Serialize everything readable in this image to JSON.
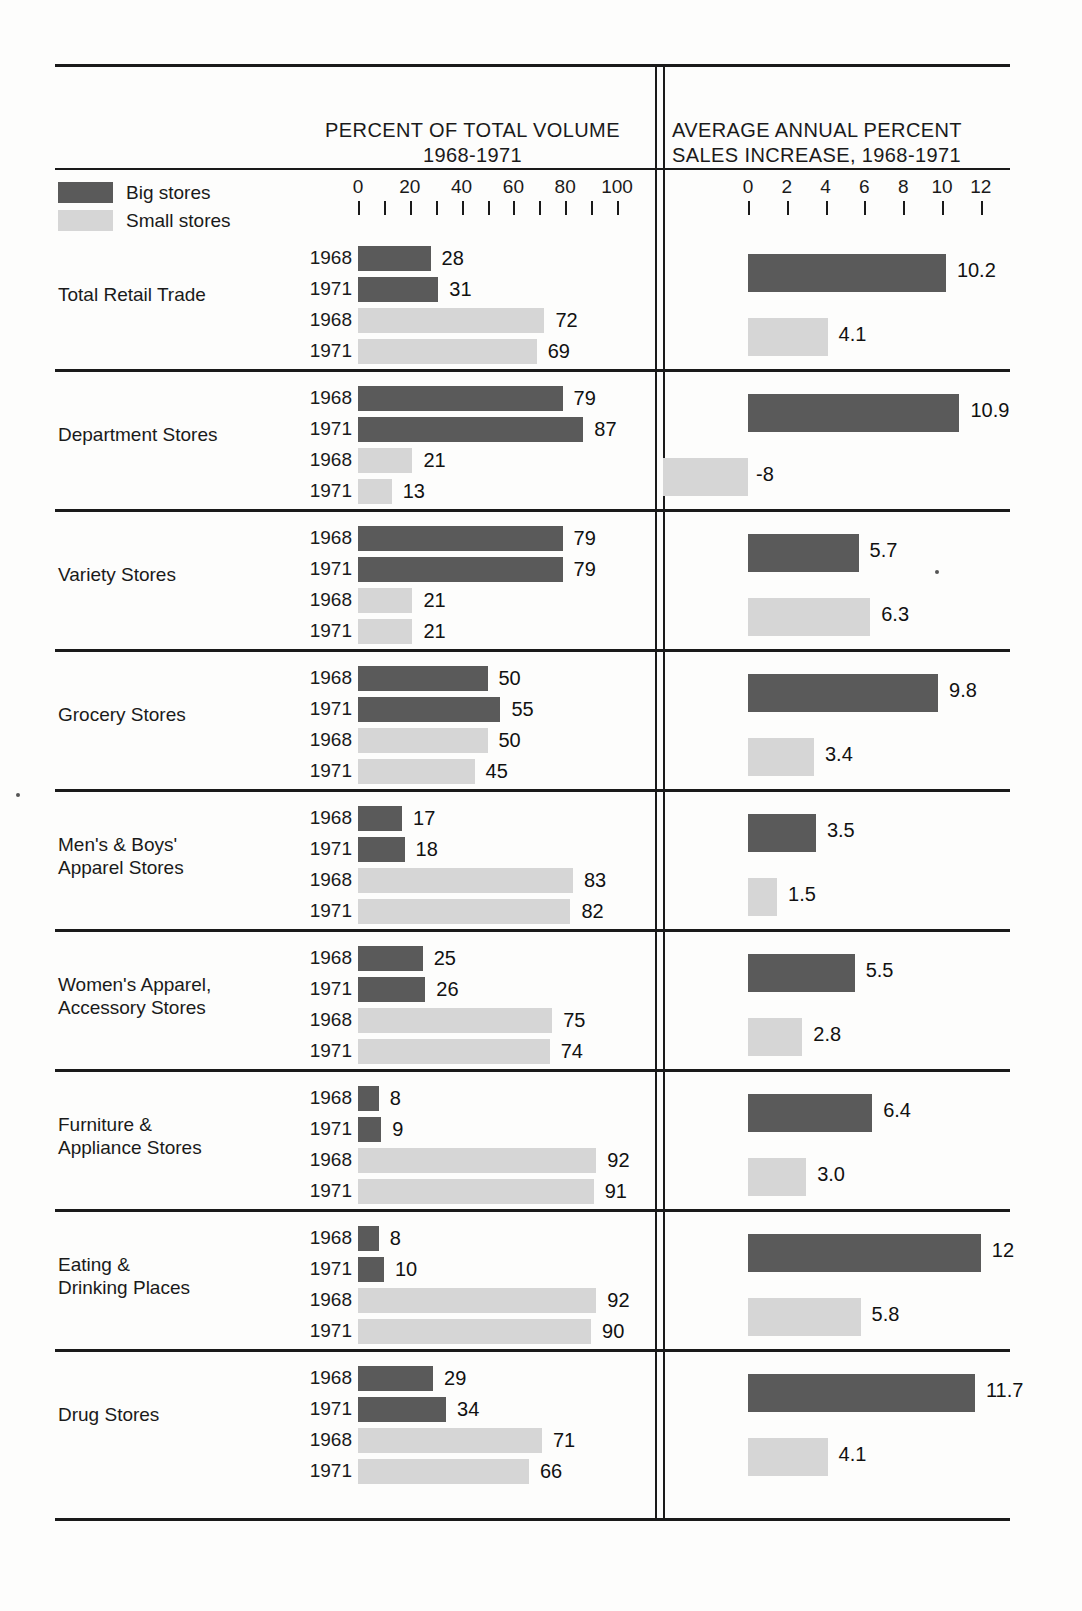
{
  "headers": {
    "left_title_line1": "PERCENT OF TOTAL VOLUME",
    "left_title_line2": "1968-1971",
    "right_title_line1": "AVERAGE ANNUAL PERCENT",
    "right_title_line2": "SALES INCREASE, 1968-1971"
  },
  "legend": {
    "big_label": "Big stores",
    "small_label": "Small stores",
    "big_color": "#5a5a5a",
    "small_color": "#d6d6d6"
  },
  "axes": {
    "left": {
      "labels": [
        "0",
        "20",
        "40",
        "60",
        "80",
        "100"
      ],
      "min": 0,
      "max": 100,
      "tick_step": 10
    },
    "right": {
      "labels": [
        "0",
        "2",
        "4",
        "6",
        "8",
        "10",
        "12"
      ],
      "min": 0,
      "max": 12,
      "tick_step": 2
    }
  },
  "years": {
    "y1": "1968",
    "y2": "1971"
  },
  "chart_data": {
    "type": "bar",
    "xlabel": "",
    "ylabel": "",
    "panels": [
      {
        "name": "percent-of-total-volume",
        "title": "PERCENT OF TOTAL VOLUME 1968-1971",
        "xlim": [
          0,
          100
        ],
        "tick_step": 10,
        "tick_labels": [
          "0",
          "20",
          "40",
          "60",
          "80",
          "100"
        ]
      },
      {
        "name": "average-annual-percent-sales-increase",
        "title": "AVERAGE ANNUAL PERCENT SALES INCREASE, 1968-1971",
        "xlim": [
          0,
          12
        ],
        "tick_step": 2,
        "tick_labels": [
          "0",
          "2",
          "4",
          "6",
          "8",
          "10",
          "12"
        ]
      }
    ],
    "legend": [
      "Big stores",
      "Small stores"
    ],
    "legend_position": "top-left",
    "grid": false,
    "categories": [
      "Total Retail Trade",
      "Department Stores",
      "Variety Stores",
      "Grocery Stores",
      "Men's & Boys' Apparel Stores",
      "Women's Apparel, Accessory Stores",
      "Furniture & Appliance Stores",
      "Eating & Drinking Places",
      "Drug Stores"
    ],
    "series": [
      {
        "name": "Big stores share 1968",
        "panel": "percent-of-total-volume",
        "values": [
          28,
          79,
          79,
          50,
          17,
          25,
          8,
          8,
          29
        ]
      },
      {
        "name": "Big stores share 1971",
        "panel": "percent-of-total-volume",
        "values": [
          31,
          87,
          79,
          55,
          18,
          26,
          9,
          10,
          34
        ]
      },
      {
        "name": "Small stores share 1968",
        "panel": "percent-of-total-volume",
        "values": [
          72,
          21,
          21,
          50,
          83,
          75,
          92,
          92,
          71
        ]
      },
      {
        "name": "Small stores share 1971",
        "panel": "percent-of-total-volume",
        "values": [
          69,
          13,
          21,
          45,
          82,
          74,
          91,
          90,
          66
        ]
      },
      {
        "name": "Big stores sales increase",
        "panel": "average-annual-percent-sales-increase",
        "values": [
          10.2,
          10.9,
          5.7,
          9.8,
          3.5,
          5.5,
          6.4,
          12,
          11.7
        ]
      },
      {
        "name": "Small stores sales increase",
        "panel": "average-annual-percent-sales-increase",
        "values": [
          4.1,
          -8,
          6.3,
          3.4,
          1.5,
          2.8,
          3.0,
          5.8,
          4.1
        ]
      }
    ]
  },
  "groups": [
    {
      "name_line1": "Total Retail Trade",
      "name_line2": "",
      "left": [
        {
          "year": "1968",
          "type": "big",
          "value": 28,
          "label": "28"
        },
        {
          "year": "1971",
          "type": "big",
          "value": 31,
          "label": "31"
        },
        {
          "year": "1968",
          "type": "small",
          "value": 72,
          "label": "72"
        },
        {
          "year": "1971",
          "type": "small",
          "value": 69,
          "label": "69"
        }
      ],
      "right": [
        {
          "type": "big",
          "value": 10.2,
          "label": "10.2"
        },
        {
          "type": "small",
          "value": 4.1,
          "label": "4.1"
        }
      ]
    },
    {
      "name_line1": "Department Stores",
      "name_line2": "",
      "left": [
        {
          "year": "1968",
          "type": "big",
          "value": 79,
          "label": "79"
        },
        {
          "year": "1971",
          "type": "big",
          "value": 87,
          "label": "87"
        },
        {
          "year": "1968",
          "type": "small",
          "value": 21,
          "label": "21"
        },
        {
          "year": "1971",
          "type": "small",
          "value": 13,
          "label": "13"
        }
      ],
      "right": [
        {
          "type": "big",
          "value": 10.9,
          "label": "10.9"
        },
        {
          "type": "small",
          "value": -8,
          "label": "-8"
        }
      ]
    },
    {
      "name_line1": "Variety Stores",
      "name_line2": "",
      "left": [
        {
          "year": "1968",
          "type": "big",
          "value": 79,
          "label": "79"
        },
        {
          "year": "1971",
          "type": "big",
          "value": 79,
          "label": "79"
        },
        {
          "year": "1968",
          "type": "small",
          "value": 21,
          "label": "21"
        },
        {
          "year": "1971",
          "type": "small",
          "value": 21,
          "label": "21"
        }
      ],
      "right": [
        {
          "type": "big",
          "value": 5.7,
          "label": "5.7"
        },
        {
          "type": "small",
          "value": 6.3,
          "label": "6.3"
        }
      ]
    },
    {
      "name_line1": "Grocery Stores",
      "name_line2": "",
      "left": [
        {
          "year": "1968",
          "type": "big",
          "value": 50,
          "label": "50"
        },
        {
          "year": "1971",
          "type": "big",
          "value": 55,
          "label": "55"
        },
        {
          "year": "1968",
          "type": "small",
          "value": 50,
          "label": "50"
        },
        {
          "year": "1971",
          "type": "small",
          "value": 45,
          "label": "45"
        }
      ],
      "right": [
        {
          "type": "big",
          "value": 9.8,
          "label": "9.8"
        },
        {
          "type": "small",
          "value": 3.4,
          "label": "3.4"
        }
      ]
    },
    {
      "name_line1": "Men's & Boys'",
      "name_line2": "Apparel Stores",
      "left": [
        {
          "year": "1968",
          "type": "big",
          "value": 17,
          "label": "17"
        },
        {
          "year": "1971",
          "type": "big",
          "value": 18,
          "label": "18"
        },
        {
          "year": "1968",
          "type": "small",
          "value": 83,
          "label": "83"
        },
        {
          "year": "1971",
          "type": "small",
          "value": 82,
          "label": "82"
        }
      ],
      "right": [
        {
          "type": "big",
          "value": 3.5,
          "label": "3.5"
        },
        {
          "type": "small",
          "value": 1.5,
          "label": "1.5"
        }
      ]
    },
    {
      "name_line1": "Women's Apparel,",
      "name_line2": "Accessory Stores",
      "left": [
        {
          "year": "1968",
          "type": "big",
          "value": 25,
          "label": "25"
        },
        {
          "year": "1971",
          "type": "big",
          "value": 26,
          "label": "26"
        },
        {
          "year": "1968",
          "type": "small",
          "value": 75,
          "label": "75"
        },
        {
          "year": "1971",
          "type": "small",
          "value": 74,
          "label": "74"
        }
      ],
      "right": [
        {
          "type": "big",
          "value": 5.5,
          "label": "5.5"
        },
        {
          "type": "small",
          "value": 2.8,
          "label": "2.8"
        }
      ]
    },
    {
      "name_line1": "Furniture &",
      "name_line2": "Appliance Stores",
      "left": [
        {
          "year": "1968",
          "type": "big",
          "value": 8,
          "label": "8"
        },
        {
          "year": "1971",
          "type": "big",
          "value": 9,
          "label": "9"
        },
        {
          "year": "1968",
          "type": "small",
          "value": 92,
          "label": "92"
        },
        {
          "year": "1971",
          "type": "small",
          "value": 91,
          "label": "91"
        }
      ],
      "right": [
        {
          "type": "big",
          "value": 6.4,
          "label": "6.4"
        },
        {
          "type": "small",
          "value": 3.0,
          "label": "3.0"
        }
      ]
    },
    {
      "name_line1": "Eating &",
      "name_line2": "Drinking Places",
      "left": [
        {
          "year": "1968",
          "type": "big",
          "value": 8,
          "label": "8"
        },
        {
          "year": "1971",
          "type": "big",
          "value": 10,
          "label": "10"
        },
        {
          "year": "1968",
          "type": "small",
          "value": 92,
          "label": "92"
        },
        {
          "year": "1971",
          "type": "small",
          "value": 90,
          "label": "90"
        }
      ],
      "right": [
        {
          "type": "big",
          "value": 12,
          "label": "12"
        },
        {
          "type": "small",
          "value": 5.8,
          "label": "5.8"
        }
      ]
    },
    {
      "name_line1": "Drug Stores",
      "name_line2": "",
      "left": [
        {
          "year": "1968",
          "type": "big",
          "value": 29,
          "label": "29"
        },
        {
          "year": "1971",
          "type": "big",
          "value": 34,
          "label": "34"
        },
        {
          "year": "1968",
          "type": "small",
          "value": 71,
          "label": "71"
        },
        {
          "year": "1971",
          "type": "small",
          "value": 66,
          "label": "66"
        }
      ],
      "right": [
        {
          "type": "big",
          "value": 11.7,
          "label": "11.7"
        },
        {
          "type": "small",
          "value": 4.1,
          "label": "4.1"
        }
      ]
    }
  ]
}
